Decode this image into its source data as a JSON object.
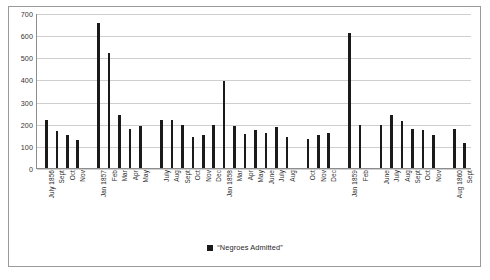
{
  "chart_data": {
    "type": "bar",
    "title": "",
    "subtitle": "",
    "xlabel": "",
    "ylabel": "",
    "ylim": [
      0,
      700
    ],
    "yticks": [
      0,
      100,
      200,
      300,
      400,
      500,
      600,
      700
    ],
    "grid": true,
    "legend_position": "bottom-center",
    "series_name": "“Negroes Admitted”",
    "bar_color": "#1a1a1a",
    "categories": [
      "July 1856",
      "Sept",
      "Oct",
      "Nov",
      "Jan 1857",
      "Feb",
      "Mar",
      "Apr",
      "May",
      "July",
      "Aug",
      "Sept",
      "Oct",
      "Nov",
      "Dec",
      "Jan 1858",
      "Mar",
      "Apr",
      "May",
      "June",
      "July",
      "Aug",
      "Oct",
      "Nov",
      "Dec",
      "Jan 1859",
      "Feb",
      "June",
      "July",
      "Aug",
      "Sept",
      "Oct",
      "Nov",
      "Aug 1860",
      "Sept"
    ],
    "values": [
      218,
      168,
      150,
      128,
      655,
      518,
      240,
      178,
      192,
      218,
      218,
      196,
      140,
      148,
      196,
      395,
      188,
      152,
      172,
      160,
      185,
      140,
      130,
      148,
      160,
      612,
      196,
      196,
      238,
      212,
      176,
      172,
      148,
      175,
      112
    ],
    "gaps_after_index": [
      3,
      8,
      21,
      24,
      26,
      32
    ]
  },
  "legend": {
    "label": "“Negroes Admitted”",
    "swatch_name": "legend-swatch"
  }
}
